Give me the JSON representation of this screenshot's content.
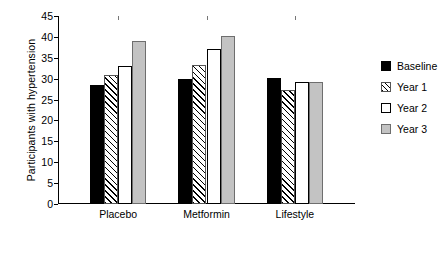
{
  "chart_data": {
    "type": "bar",
    "title": "",
    "xlabel": "",
    "ylabel": "Participants with hypertension",
    "categories": [
      "Placebo",
      "Metformin",
      "Lifestyle"
    ],
    "series": [
      {
        "name": "Baseline",
        "values": [
          28.4,
          30.0,
          30.1
        ],
        "color": "#000000",
        "fill": "solid"
      },
      {
        "name": "Year 1",
        "values": [
          30.8,
          33.2,
          27.3
        ],
        "color": "#ffffff",
        "fill": "diagonal-hatch"
      },
      {
        "name": "Year 2",
        "values": [
          33.0,
          37.0,
          29.2
        ],
        "color": "#ffffff",
        "fill": "empty"
      },
      {
        "name": "Year 3",
        "values": [
          39.0,
          40.2,
          29.2
        ],
        "color": "#c3c3c3",
        "fill": "gray"
      }
    ],
    "ylim": [
      0,
      45
    ],
    "yticks": [
      0,
      5,
      10,
      15,
      20,
      25,
      30,
      35,
      40,
      45
    ],
    "ytick_labels": [
      "0",
      "5",
      "10",
      "15",
      "20",
      "25",
      "30",
      "35",
      "40",
      "45"
    ],
    "grid": false,
    "legend_position": "right"
  }
}
